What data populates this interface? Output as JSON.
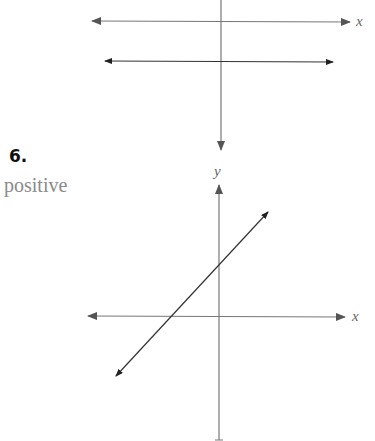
{
  "problem": {
    "number": "6.",
    "answer": "positive"
  },
  "top_graph": {
    "x_axis_label": "x"
  },
  "bottom_graph": {
    "x_axis_label": "x",
    "y_axis_label": "y"
  },
  "colors": {
    "axis": "#777777",
    "line": "#444444",
    "answer_text": "#8a8a8a"
  }
}
